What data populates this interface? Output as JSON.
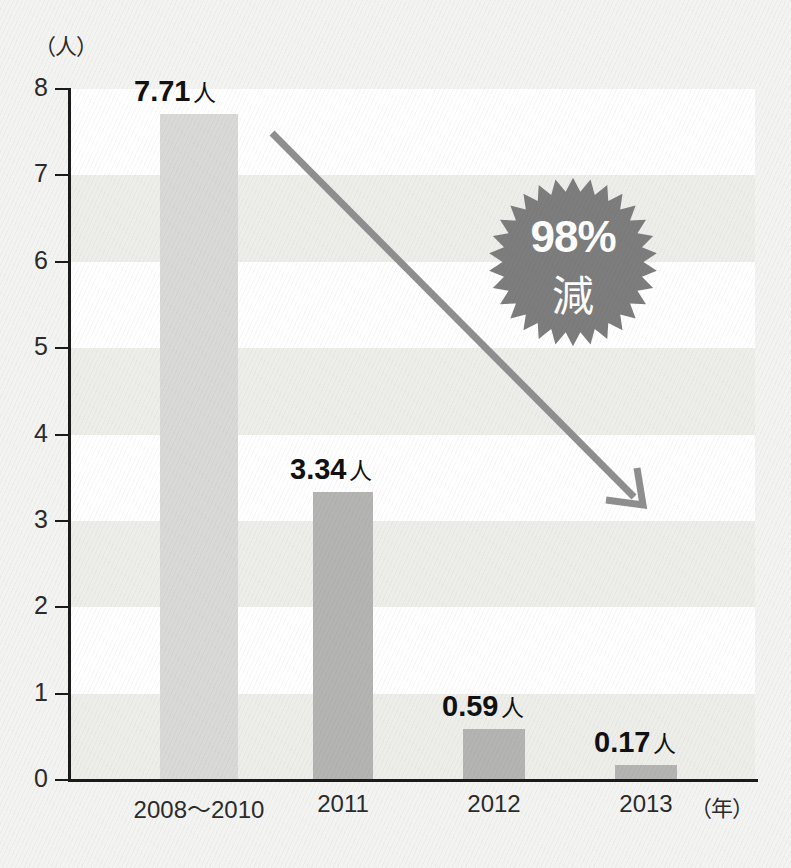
{
  "chart_data": {
    "type": "bar",
    "title": "",
    "xlabel": "年",
    "ylabel": "人",
    "ylim": [
      0,
      8
    ],
    "grid": "horizontal-bands",
    "legend": "none",
    "categories": [
      "2008〜2010",
      "2011",
      "2012",
      "2013"
    ],
    "values": [
      7.71,
      3.34,
      0.59,
      0.17
    ],
    "value_labels": [
      "7.71",
      "3.34",
      "0.59",
      "0.17"
    ],
    "value_unit": "人",
    "y_ticks": [
      "0",
      "1",
      "2",
      "3",
      "4",
      "5",
      "6",
      "7",
      "8"
    ],
    "axis_unit_y": "（人）",
    "axis_unit_x": "（年）",
    "annotations": [
      {
        "name": "reduction-badge",
        "percent": "98%",
        "word": "減",
        "shape": "starburst"
      },
      {
        "name": "downward-trend-arrow",
        "shape": "arrow",
        "direction": "down-right"
      }
    ],
    "colors": {
      "bar_first": "#d9d9d7",
      "bar_rest": "#b4b4b2",
      "band": "#ededea",
      "plot_background": "#ffffff",
      "page_background": "#f3f3f1",
      "axis": "#1b1b1b",
      "label_text": "#111111",
      "badge_fill": "#7d7d7d",
      "badge_text": "#ffffff",
      "arrow": "#8f8f8f"
    }
  },
  "bars": [
    {
      "category": "2008〜2010",
      "value_text": "7.71",
      "unit": "人"
    },
    {
      "category": "2011",
      "value_text": "3.34",
      "unit": "人"
    },
    {
      "category": "2012",
      "value_text": "0.59",
      "unit": "人"
    },
    {
      "category": "2013",
      "value_text": "0.17",
      "unit": "人"
    }
  ],
  "y_ticks": [
    "8",
    "7",
    "6",
    "5",
    "4",
    "3",
    "2",
    "1",
    "0"
  ],
  "badge": {
    "percent": "98%",
    "word": "減"
  },
  "axis_units": {
    "y": "（人）",
    "x": "（年）"
  }
}
